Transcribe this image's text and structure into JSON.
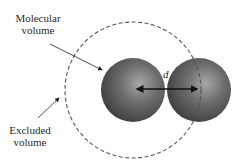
{
  "labels": {
    "molecular_line1": "Molecular",
    "molecular_line2": "volume",
    "excluded_line1": "Excluded",
    "excluded_line2": "volume",
    "distance": "d"
  },
  "colors": {
    "sphere_dark": "#4a4a4a",
    "sphere_light": "#9a9a9a",
    "dashed_circle": "#555555",
    "arrow": "#111111"
  }
}
